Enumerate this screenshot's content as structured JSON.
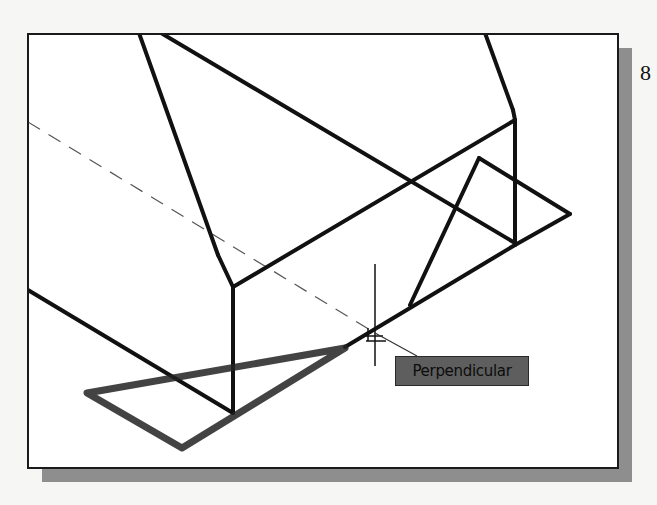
{
  "figure": {
    "page_number": "8",
    "snap_tooltip": "Perpendicular",
    "colors": {
      "background": "#f6f6f4",
      "viewport": "#ffffff",
      "line": "#111111",
      "shadow": "#8e8e8e",
      "tooltip_bg": "#5e5e5e"
    },
    "cursor": {
      "x": 375,
      "y": 335
    }
  }
}
